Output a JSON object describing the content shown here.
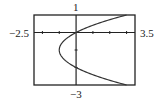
{
  "chart_data": {
    "type": "line",
    "title": "",
    "xlabel": "",
    "ylabel": "",
    "equation": "x = y^2 + 2y",
    "xlim": [
      -2.5,
      3.5
    ],
    "ylim": [
      -3,
      1
    ],
    "grid": false,
    "tick_labels": {
      "xmin": "−2.5",
      "xmax": "3.5",
      "ymax": "1",
      "ymin": "−3"
    },
    "x_ticks": [
      -2,
      -1,
      1,
      2,
      3
    ],
    "y_ticks": [
      -2,
      -1
    ],
    "series": [
      {
        "name": "parabola",
        "points": [
          {
            "y": 1,
            "x": 3
          },
          {
            "y": 0.5,
            "x": 1.25
          },
          {
            "y": 0,
            "x": 0
          },
          {
            "y": -0.5,
            "x": -0.75
          },
          {
            "y": -1,
            "x": -1
          },
          {
            "y": -1.5,
            "x": -0.75
          },
          {
            "y": -2,
            "x": 0
          },
          {
            "y": -2.5,
            "x": 1.25
          },
          {
            "y": -3,
            "x": 3
          }
        ]
      }
    ]
  },
  "colors": {
    "frame": "#222222",
    "curve": "#333333"
  }
}
